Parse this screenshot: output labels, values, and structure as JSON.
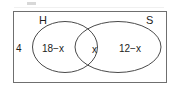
{
  "diagram": {
    "type": "venn-diagram",
    "universal_set": {
      "outside_value": "4"
    },
    "sets": [
      {
        "key": "H",
        "label": "H",
        "position": "left"
      },
      {
        "key": "S",
        "label": "S",
        "position": "right"
      }
    ],
    "regions": [
      {
        "key": "h_only",
        "label": "18−x",
        "description": "H only"
      },
      {
        "key": "intersection",
        "label": "x",
        "description": "H and S"
      },
      {
        "key": "s_only",
        "label": "12−x",
        "description": "S only"
      },
      {
        "key": "outside",
        "label": "4",
        "description": "Neither H nor S"
      }
    ],
    "colors": {
      "stroke": "#4a4a4a",
      "frame": "#6f6f6f",
      "text": "#1c1c1c",
      "background": "#ffffff"
    }
  }
}
